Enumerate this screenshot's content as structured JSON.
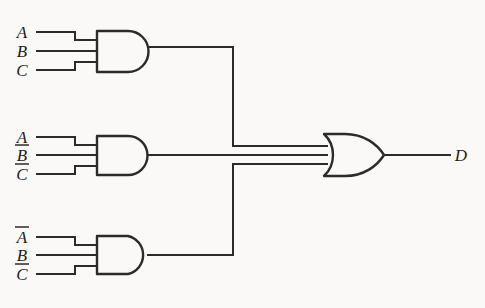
{
  "diagram": {
    "background_color": "#faf9f7",
    "line_color": "#2b2b2b",
    "expression": "D = ABC + AB'C' + A'BC'"
  },
  "gates": [
    {
      "id": "and-gate-1",
      "type": "AND",
      "inputs": [
        {
          "label": "A",
          "overbar": false
        },
        {
          "label": "B",
          "overbar": false
        },
        {
          "label": "C",
          "overbar": false
        }
      ]
    },
    {
      "id": "and-gate-2",
      "type": "AND",
      "inputs": [
        {
          "label": "A",
          "overbar": false
        },
        {
          "label": "B",
          "overbar": true
        },
        {
          "label": "C",
          "overbar": true
        }
      ]
    },
    {
      "id": "and-gate-3",
      "type": "AND",
      "inputs": [
        {
          "label": "A",
          "overbar": true
        },
        {
          "label": "B",
          "overbar": false
        },
        {
          "label": "C",
          "overbar": true
        }
      ]
    },
    {
      "id": "or-gate-1",
      "type": "OR",
      "inputs": [
        {
          "label": "",
          "overbar": false
        },
        {
          "label": "",
          "overbar": false
        },
        {
          "label": "",
          "overbar": false
        }
      ]
    }
  ],
  "labels": {
    "g1_in1": "A",
    "g1_in2": "B",
    "g1_in3": "C",
    "g2_in1": "A",
    "g2_in2": "B",
    "g2_in3": "C",
    "g3_in1": "A",
    "g3_in2": "B",
    "g3_in3": "C",
    "output": "D"
  }
}
